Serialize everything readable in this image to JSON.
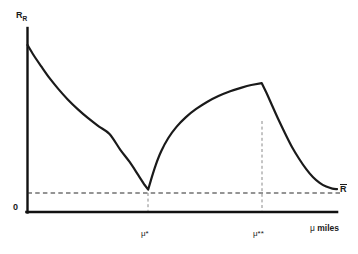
{
  "chart_data": {
    "type": "line",
    "title": "",
    "subtitle": "",
    "xlabel": "μ miles",
    "ylabel": "R",
    "ylabel_subscript": "R",
    "origin_label": "0",
    "grid": false,
    "legend": null,
    "xlim": [
      0,
      1
    ],
    "ylim": [
      0,
      1
    ],
    "axis_ticks_shown": false,
    "annotations": [
      {
        "name": "mu-star",
        "text": "μ*",
        "x_norm": 0.39,
        "note": "local minimum of R_R, touches R-bar level"
      },
      {
        "name": "mu-star-star",
        "text": "μ**",
        "x_norm": 0.757,
        "note": "local maximum / peak of second branch"
      },
      {
        "name": "r-bar",
        "text": "R",
        "overbar": true,
        "y_norm": 0.122,
        "note": "horizontal dashed reference level R-bar"
      }
    ],
    "reference_lines": [
      {
        "name": "r-bar-horizontal",
        "orientation": "horizontal",
        "value_norm": 0.122,
        "style": "dashed"
      },
      {
        "name": "mu-star-vertical",
        "orientation": "vertical",
        "value_norm": 0.39,
        "style": "dashed"
      },
      {
        "name": "mu-star-star-vertical",
        "orientation": "vertical",
        "value_norm": 0.757,
        "style": "dashed"
      }
    ],
    "series": [
      {
        "name": "R_R",
        "style": "solid",
        "color": "#1a1a1a",
        "width": 2.2,
        "points_norm": [
          [
            0.0,
            0.908
          ],
          [
            0.02,
            0.852
          ],
          [
            0.045,
            0.79
          ],
          [
            0.072,
            0.726
          ],
          [
            0.1,
            0.668
          ],
          [
            0.13,
            0.612
          ],
          [
            0.163,
            0.558
          ],
          [
            0.196,
            0.51
          ],
          [
            0.23,
            0.466
          ],
          [
            0.265,
            0.424
          ],
          [
            0.3,
            0.338
          ],
          [
            0.33,
            0.272
          ],
          [
            0.358,
            0.2
          ],
          [
            0.378,
            0.148
          ],
          [
            0.39,
            0.122
          ],
          [
            0.4,
            0.18
          ],
          [
            0.414,
            0.254
          ],
          [
            0.432,
            0.33
          ],
          [
            0.455,
            0.402
          ],
          [
            0.482,
            0.464
          ],
          [
            0.512,
            0.516
          ],
          [
            0.545,
            0.56
          ],
          [
            0.58,
            0.598
          ],
          [
            0.617,
            0.63
          ],
          [
            0.655,
            0.656
          ],
          [
            0.692,
            0.676
          ],
          [
            0.723,
            0.69
          ],
          [
            0.757,
            0.7
          ],
          [
            0.772,
            0.648
          ],
          [
            0.79,
            0.58
          ],
          [
            0.81,
            0.505
          ],
          [
            0.832,
            0.428
          ],
          [
            0.855,
            0.352
          ],
          [
            0.878,
            0.288
          ],
          [
            0.9,
            0.234
          ],
          [
            0.922,
            0.19
          ],
          [
            0.944,
            0.158
          ],
          [
            0.965,
            0.138
          ],
          [
            0.985,
            0.127
          ],
          [
            1.0,
            0.124
          ]
        ]
      }
    ]
  },
  "labels": {
    "y_axis": "R",
    "y_axis_sub": "R",
    "x_axis": " miles",
    "x_axis_mu": "μ",
    "origin": "0",
    "mu_star": "μ*",
    "mu_star_star": "μ**",
    "r_bar": "R"
  },
  "colors": {
    "background": "#ffffff",
    "curve": "#1a1a1a",
    "axis": "#111111",
    "dashed": "#333333",
    "text": "#1a1a1a"
  }
}
